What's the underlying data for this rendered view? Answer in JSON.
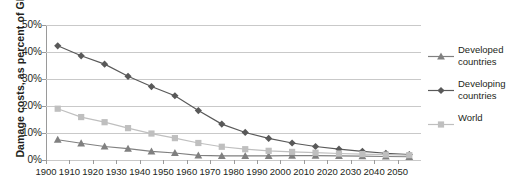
{
  "chart_data": {
    "type": "line",
    "title": "",
    "xlabel": "",
    "ylabel": "Damage costs, as percent of GDP",
    "xlim": [
      1900,
      2060
    ],
    "ylim": [
      0,
      50
    ],
    "yticks": [
      "0%",
      "10%",
      "20%",
      "30%",
      "40%",
      "50%"
    ],
    "ytick_values": [
      0,
      10,
      20,
      30,
      40,
      50
    ],
    "xticks": [
      "1900",
      "1910",
      "1920",
      "1930",
      "1940",
      "1950",
      "1960",
      "1970",
      "1980",
      "1990",
      "2000",
      "2010",
      "2020",
      "2030",
      "2040",
      "2050"
    ],
    "xtick_values": [
      1900,
      1910,
      1920,
      1930,
      1940,
      1950,
      1960,
      1970,
      1980,
      1990,
      2000,
      2010,
      2020,
      2030,
      2040,
      2050
    ],
    "x": [
      1905,
      1915,
      1925,
      1935,
      1945,
      1955,
      1965,
      1975,
      1985,
      1995,
      2005,
      2015,
      2025,
      2035,
      2045,
      2055
    ],
    "grid": "horizontal",
    "legend_position": "right",
    "series": [
      {
        "name": "Developed countries",
        "marker": "triangle",
        "color": "#808080",
        "values": [
          7.5,
          6.2,
          5.0,
          4.2,
          3.2,
          2.6,
          1.7,
          1.5,
          1.5,
          1.5,
          1.6,
          1.6,
          1.5,
          1.4,
          1.3,
          1.2
        ]
      },
      {
        "name": "Developing countries",
        "marker": "diamond",
        "color": "#595959",
        "values": [
          42.3,
          38.6,
          35.5,
          31.0,
          27.2,
          23.8,
          18.3,
          13.3,
          10.2,
          8.0,
          6.3,
          5.0,
          4.0,
          3.2,
          2.5,
          2.0
        ]
      },
      {
        "name": "World",
        "marker": "square",
        "color": "#bfbfbf",
        "values": [
          19.0,
          15.9,
          14.0,
          11.8,
          9.8,
          8.1,
          6.3,
          4.9,
          4.0,
          3.4,
          3.0,
          2.7,
          2.4,
          2.2,
          2.0,
          1.8
        ]
      }
    ]
  },
  "legend": {
    "items": [
      {
        "label_line1": "Developed",
        "label_line2": "countries",
        "marker": "triangle-marker"
      },
      {
        "label_line1": "Developing",
        "label_line2": "countries",
        "marker": "diamond-marker"
      },
      {
        "label_line1": "World",
        "label_line2": "",
        "marker": "square-marker"
      }
    ]
  }
}
